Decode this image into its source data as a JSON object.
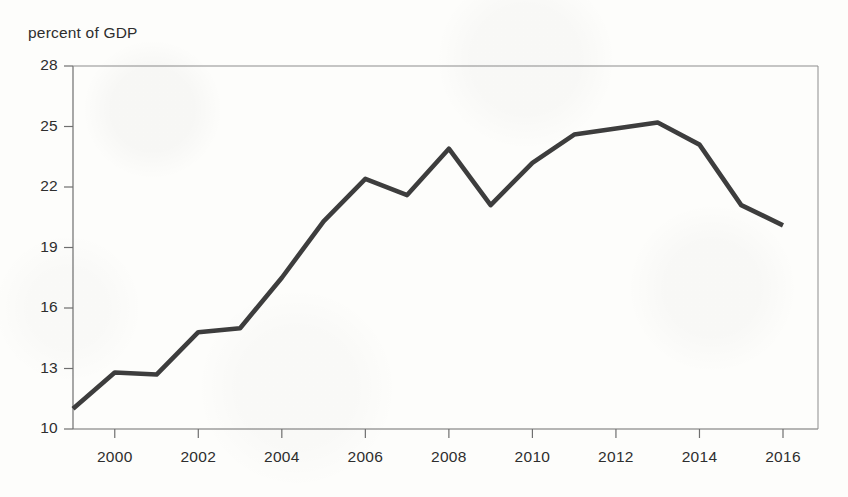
{
  "figure": {
    "axis_title": "percent of GDP",
    "line_color": "#3d3d3d",
    "axis_color": "#6f6f6f",
    "background_color": "#fdfdfb",
    "text_color": "#2e2e2e"
  },
  "chart_data": {
    "type": "line",
    "title": "",
    "subtitle": "",
    "xlabel": "",
    "ylabel": "percent of GDP",
    "ylim": [
      10,
      28
    ],
    "xlim": [
      1999,
      2016
    ],
    "grid": false,
    "legend": "none",
    "y_ticks": [
      10,
      13,
      16,
      19,
      22,
      25,
      28
    ],
    "y_tick_labels": [
      "10",
      "13",
      "16",
      "19",
      "22",
      "25",
      "28"
    ],
    "x_ticks": [
      2000,
      2002,
      2004,
      2006,
      2008,
      2010,
      2012,
      2014,
      2016
    ],
    "x_tick_labels": [
      "2000",
      "2002",
      "2004",
      "2006",
      "2008",
      "2010",
      "2012",
      "2014",
      "2016"
    ],
    "x": [
      1999,
      2000,
      2001,
      2002,
      2003,
      2004,
      2005,
      2006,
      2007,
      2008,
      2009,
      2010,
      2011,
      2012,
      2013,
      2014,
      2015,
      2016
    ],
    "values": [
      11.0,
      12.8,
      12.7,
      14.8,
      15.0,
      17.5,
      20.3,
      22.4,
      21.6,
      23.9,
      21.1,
      23.2,
      24.6,
      24.9,
      25.2,
      24.1,
      21.1,
      20.1
    ],
    "series": [
      {
        "name": "percent of GDP",
        "values": [
          11.0,
          12.8,
          12.7,
          14.8,
          15.0,
          17.5,
          20.3,
          22.4,
          21.6,
          23.9,
          21.1,
          23.2,
          24.6,
          24.9,
          25.2,
          24.1,
          21.1,
          20.1
        ]
      }
    ]
  }
}
